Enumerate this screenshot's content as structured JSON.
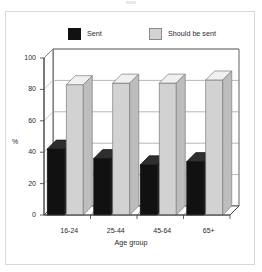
{
  "figure": {
    "background_color": "#ffffff",
    "frame_color": "#d8d8d8"
  },
  "legend": {
    "position": "top",
    "entries": [
      {
        "label": "Sent",
        "color": "#111111",
        "swatch": "legend-swatch-sent"
      },
      {
        "label": "Should be sent",
        "color": "#d2d2d2",
        "swatch": "legend-swatch-should-be-sent"
      }
    ]
  },
  "chart_data": {
    "type": "bar",
    "title": "",
    "subtitle": "",
    "xlabel": "Age group",
    "ylabel": "%",
    "categories": [
      "16-24",
      "25-44",
      "45-64",
      "65+"
    ],
    "series": [
      {
        "name": "Sent",
        "color": "#111111",
        "values": [
          42,
          36,
          32,
          34
        ]
      },
      {
        "name": "Should be sent",
        "color": "#d2d2d2",
        "values": [
          83,
          84,
          84,
          86
        ]
      }
    ],
    "ylim": [
      0,
      100
    ],
    "yticks": [
      0,
      20,
      40,
      60,
      80,
      100
    ],
    "ytick_labels": [
      "0",
      "20",
      "40",
      "60",
      "80",
      "100"
    ],
    "grid": true,
    "grid_axis": "y",
    "legend_position": "top",
    "style": "3d-grouped-bar",
    "units": "percent"
  }
}
